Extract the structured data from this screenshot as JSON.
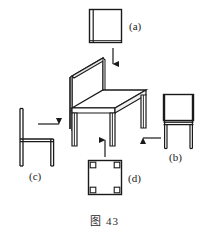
{
  "figure": {
    "caption": "图 43",
    "title": "图 43",
    "stroke_color": "#1a1a1a",
    "fill_color": "#ffffff",
    "background_color": "#ffffff"
  },
  "views": {
    "a": {
      "label": "(a)",
      "name": "rear-elevation-square",
      "position": "top",
      "shape": "square with vertical double line at left edge",
      "box": {
        "x": 89,
        "y": 9,
        "w": 33,
        "h": 34
      }
    },
    "b": {
      "label": "(b)",
      "name": "front-elevation",
      "position": "right",
      "shape": "square backrest over seat line with two legs",
      "box": {
        "x": 163,
        "y": 94,
        "w": 31,
        "h": 55
      }
    },
    "c": {
      "label": "(c)",
      "name": "side-elevation",
      "position": "left",
      "shape": "tall back post with horizontal seat and legs",
      "box": {
        "x": 18,
        "y": 108,
        "w": 36,
        "h": 58
      }
    },
    "d": {
      "label": "(d)",
      "name": "plan-view",
      "position": "bottom",
      "shape": "square with small squares at four corners",
      "box": {
        "x": 88,
        "y": 160,
        "w": 34,
        "h": 35
      }
    }
  },
  "center_object": {
    "name": "isometric-chair",
    "label": "",
    "box": {
      "x": 63,
      "y": 58,
      "w": 85,
      "h": 88
    }
  },
  "arrows": [
    {
      "name": "arrow-a-to-chair",
      "direction": "down",
      "from": "a",
      "to": "chair",
      "x1": 113,
      "y1": 48,
      "x2": 113,
      "y2": 66
    },
    {
      "name": "arrow-c-to-chair",
      "direction": "right",
      "from": "c",
      "to": "chair",
      "x1": 38,
      "y1": 124,
      "x2": 62,
      "y2": 124
    },
    {
      "name": "arrow-b-to-chair",
      "direction": "left",
      "from": "b",
      "to": "chair",
      "x1": 161,
      "y1": 138,
      "x2": 140,
      "y2": 138
    },
    {
      "name": "arrow-d-to-chair",
      "direction": "up",
      "from": "d",
      "to": "chair",
      "x1": 105,
      "y1": 157,
      "x2": 105,
      "y2": 138
    }
  ]
}
